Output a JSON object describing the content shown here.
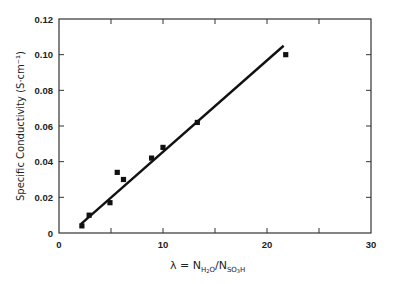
{
  "chart_data": {
    "type": "scatter",
    "title": "",
    "xlabel": "λ = N_H2O / N_SO3H",
    "xlabel_parts": {
      "lambda": "λ",
      "equals": " = ",
      "n1": "N",
      "n1_sub": "H",
      "n1_sub2": "2",
      "n1_sub3": "O",
      "slash": "/",
      "n2": "N",
      "n2_sub": "SO",
      "n2_sub2": "3",
      "n2_sub3": "H"
    },
    "ylabel": "Specific Conductivity (S·cm⁻¹)",
    "xlim": [
      0,
      30
    ],
    "ylim": [
      0,
      0.12
    ],
    "x_ticks": [
      0,
      10,
      20,
      30
    ],
    "x_tick_labels": [
      "0",
      "10",
      "20",
      "30"
    ],
    "x_minor_ticks": [
      5,
      15,
      25
    ],
    "y_ticks": [
      0,
      0.02,
      0.04,
      0.06,
      0.08,
      0.1,
      0.12
    ],
    "y_tick_labels": [
      "0",
      "0.02",
      "0.04",
      "0.06",
      "0.08",
      "0.10",
      "0.12"
    ],
    "grid": false,
    "legend": null,
    "series": [
      {
        "name": "Measured",
        "type": "scatter",
        "marker": "square",
        "color": "#111111",
        "x": [
          2.2,
          2.9,
          4.9,
          5.6,
          6.2,
          8.9,
          10.0,
          13.3,
          21.8
        ],
        "y": [
          0.004,
          0.01,
          0.017,
          0.034,
          0.03,
          0.042,
          0.048,
          0.062,
          0.1
        ]
      },
      {
        "name": "Linear fit",
        "type": "line",
        "color": "#111111",
        "x": [
          2.1,
          21.6
        ],
        "y": [
          0.005,
          0.105
        ]
      }
    ]
  }
}
